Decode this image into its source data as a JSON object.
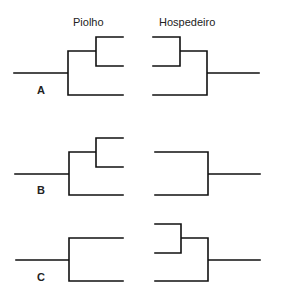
{
  "headers": {
    "parasite": "Piolho",
    "host": "Hospedeiro"
  },
  "panels": [
    {
      "label": "A",
      "parasite_tree": "((t1,t2),t3)",
      "host_tree": "((t1,t2),t3)"
    },
    {
      "label": "B",
      "parasite_tree": "((t1,t2),t3)",
      "host_tree": "(t1,t3)"
    },
    {
      "label": "C",
      "parasite_tree": "(t1,t3)",
      "host_tree": "((t0,t1),t3)"
    }
  ],
  "colors": {
    "line": "#111111",
    "text": "#222222",
    "background": "#ffffff"
  }
}
